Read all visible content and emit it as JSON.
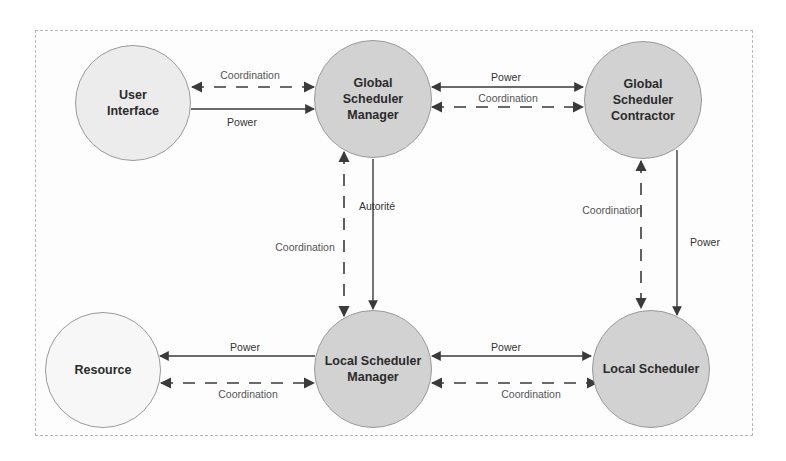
{
  "diagram": {
    "nodes": [
      {
        "id": "user_interface",
        "label": "User\nInterface",
        "cx": 133,
        "cy": 103,
        "r": 58,
        "shade": "light"
      },
      {
        "id": "global_scheduler_manager",
        "label": "Global\nScheduler\nManager",
        "cx": 373,
        "cy": 99,
        "r": 59,
        "shade": "dark"
      },
      {
        "id": "global_scheduler_contractor",
        "label": "Global\nScheduler\nContractor",
        "cx": 643,
        "cy": 100,
        "r": 59,
        "shade": "dark"
      },
      {
        "id": "resource",
        "label": "Resource",
        "cx": 103,
        "cy": 370,
        "r": 58,
        "shade": "lighter"
      },
      {
        "id": "local_scheduler_manager",
        "label": "Local Scheduler\nManager",
        "cx": 373,
        "cy": 369,
        "r": 59,
        "shade": "dark"
      },
      {
        "id": "local_scheduler",
        "label": "Local Scheduler",
        "cx": 651,
        "cy": 369,
        "r": 59,
        "shade": "dark"
      }
    ],
    "edges": [
      {
        "from": "user_interface",
        "to": "global_scheduler_manager",
        "label": "Coordination",
        "style": "dashed",
        "direction": "both"
      },
      {
        "from": "user_interface",
        "to": "global_scheduler_manager",
        "label": "Power",
        "style": "solid",
        "direction": "forward"
      },
      {
        "from": "global_scheduler_manager",
        "to": "global_scheduler_contractor",
        "label": "Power",
        "style": "solid",
        "direction": "both"
      },
      {
        "from": "global_scheduler_manager",
        "to": "global_scheduler_contractor",
        "label": "Coordination",
        "style": "dashed",
        "direction": "both"
      },
      {
        "from": "global_scheduler_manager",
        "to": "local_scheduler_manager",
        "label": "Coordination",
        "style": "dashed",
        "direction": "both"
      },
      {
        "from": "global_scheduler_manager",
        "to": "local_scheduler_manager",
        "label": "Autorité",
        "style": "solid",
        "direction": "forward"
      },
      {
        "from": "global_scheduler_contractor",
        "to": "local_scheduler",
        "label": "Coordination",
        "style": "dashed",
        "direction": "both"
      },
      {
        "from": "global_scheduler_contractor",
        "to": "local_scheduler",
        "label": "Power",
        "style": "solid",
        "direction": "forward"
      },
      {
        "from": "local_scheduler_manager",
        "to": "resource",
        "label": "Power",
        "style": "solid",
        "direction": "forward"
      },
      {
        "from": "resource",
        "to": "local_scheduler_manager",
        "label": "Coordination",
        "style": "dashed",
        "direction": "both"
      },
      {
        "from": "local_scheduler_manager",
        "to": "local_scheduler",
        "label": "Power",
        "style": "solid",
        "direction": "both"
      },
      {
        "from": "local_scheduler_manager",
        "to": "local_scheduler",
        "label": "Coordination",
        "style": "dashed",
        "direction": "both"
      }
    ],
    "labels": {
      "ui_gsm_coord": "Coordination",
      "ui_gsm_power": "Power",
      "gsm_gsc_power": "Power",
      "gsm_gsc_coord": "Coordination",
      "gsm_lsm_coord": "Coordination",
      "gsm_lsm_autorite": "Autorité",
      "gsc_ls_coord": "Coordination",
      "gsc_ls_power": "Power",
      "lsm_res_power": "Power",
      "res_lsm_coord": "Coordination",
      "lsm_ls_power": "Power",
      "lsm_ls_coord": "Coordination"
    },
    "colors": {
      "arrow": "#3a3a3a",
      "node_dark": "#d2d2d2",
      "node_light": "#ececec",
      "node_lighter": "#f7f7f7",
      "frame_border": "#b8b8b8"
    }
  }
}
